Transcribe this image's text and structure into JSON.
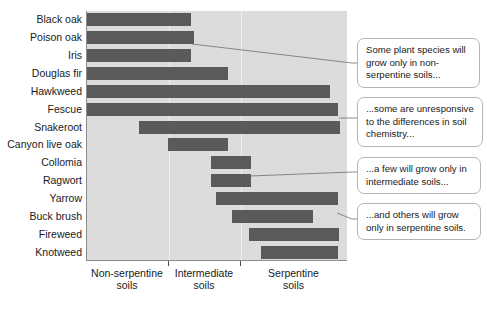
{
  "chart_data": {
    "type": "bar",
    "orientation": "horizontal",
    "title": "",
    "xlabel": "",
    "ylabel": "",
    "grid": true,
    "legend": "none",
    "x_axis": {
      "type": "categorical-gradient",
      "ticks": [
        "Non-serpentine soils",
        "Intermediate soils",
        "Serpentine soils"
      ],
      "tick_positions": [
        0.315,
        0.59
      ],
      "range": [
        0,
        1
      ]
    },
    "categories": [
      "Black oak",
      "Poison oak",
      "Iris",
      "Douglas fir",
      "Hawkweed",
      "Fescue",
      "Snakeroot",
      "Canyon live oak",
      "Collomia",
      "Ragwort",
      "Yarrow",
      "Buck brush",
      "Fireweed",
      "Knotweed"
    ],
    "series": [
      {
        "name": "Soil tolerance range",
        "spans": [
          {
            "category": "Black oak",
            "start": 0.0,
            "end": 0.4
          },
          {
            "category": "Poison oak",
            "start": 0.0,
            "end": 0.41
          },
          {
            "category": "Iris",
            "start": 0.0,
            "end": 0.4
          },
          {
            "category": "Douglas fir",
            "start": 0.0,
            "end": 0.54
          },
          {
            "category": "Hawkweed",
            "start": 0.0,
            "end": 0.93
          },
          {
            "category": "Fescue",
            "start": 0.0,
            "end": 0.96
          },
          {
            "category": "Snakeroot",
            "start": 0.2,
            "end": 0.97
          },
          {
            "category": "Canyon live oak",
            "start": 0.31,
            "end": 0.54
          },
          {
            "category": "Collomia",
            "start": 0.475,
            "end": 0.63
          },
          {
            "category": "Ragwort",
            "start": 0.475,
            "end": 0.63
          },
          {
            "category": "Yarrow",
            "start": 0.495,
            "end": 0.96
          },
          {
            "category": "Buck brush",
            "start": 0.555,
            "end": 0.865
          },
          {
            "category": "Fireweed",
            "start": 0.62,
            "end": 0.965
          },
          {
            "category": "Knotweed",
            "start": 0.665,
            "end": 0.96
          }
        ]
      }
    ],
    "annotations": [
      {
        "id": "callout-1",
        "text": "Some plant species will grow only in non-serpentine soils...",
        "anchor_category": "Poison oak"
      },
      {
        "id": "callout-2",
        "text": "...some are unresponsive to the differences in soil chemistry...",
        "anchor_category": "Fescue"
      },
      {
        "id": "callout-3",
        "text": "...a few will grow only in intermediate soils...",
        "anchor_category": "Collomia"
      },
      {
        "id": "callout-4",
        "text": "...and others will grow only in serpentine soils.",
        "anchor_category": "Yarrow"
      }
    ],
    "colors": {
      "bar": "#5a5a5a",
      "plot_background": "#dcdcdc",
      "gridline": "#efefef",
      "axis": "#8c8c8c",
      "callout_border": "#b4b4b4",
      "callout_background": "#ffffff",
      "text": "#1a1a1a",
      "page_background": "#ffffff"
    }
  },
  "axis_labels": {
    "x_tick_1_line1": "Non-serpentine",
    "x_tick_1_line2": "soils",
    "x_tick_2_line1": "Intermediate",
    "x_tick_2_line2": "soils",
    "x_tick_3_line1": "Serpentine",
    "x_tick_3_line2": "soils"
  },
  "callouts": {
    "c1": "Some plant species will grow only in non-serpentine soils...",
    "c2": "...some are unresponsive to the differences in soil chemistry...",
    "c3": "...a few will grow only in intermediate soils...",
    "c4": "...and others will grow only in serpentine soils."
  }
}
